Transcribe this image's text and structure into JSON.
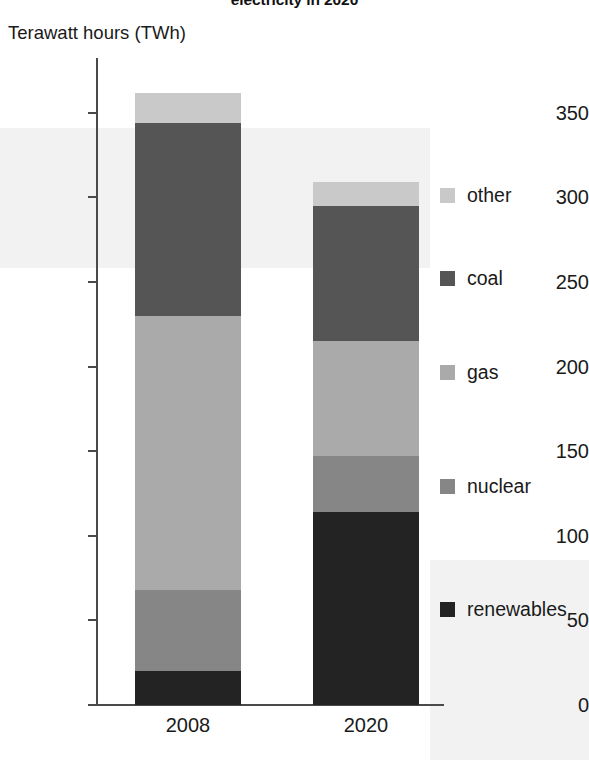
{
  "title": "electricity in 2020",
  "y_axis_label": "Terawatt hours (TWh)",
  "y_ticks": [
    {
      "label": "350",
      "value": 350
    },
    {
      "label": "300",
      "value": 300
    },
    {
      "label": "250",
      "value": 250
    },
    {
      "label": "200",
      "value": 200
    },
    {
      "label": "150",
      "value": 150
    },
    {
      "label": "100",
      "value": 100
    },
    {
      "label": "50",
      "value": 50
    },
    {
      "label": "0",
      "value": 0
    }
  ],
  "x_labels": [
    "2008",
    "2020"
  ],
  "legend": [
    {
      "label": "other",
      "color": "#c9c9c9"
    },
    {
      "label": "coal",
      "color": "#555555"
    },
    {
      "label": "gas",
      "color": "#aaaaaa"
    },
    {
      "label": "nuclear",
      "color": "#868686"
    },
    {
      "label": "renewables",
      "color": "#232323"
    }
  ],
  "chart_data": {
    "type": "bar",
    "stacked": true,
    "title": "electricity in 2020",
    "xlabel": "",
    "ylabel": "Terawatt hours (TWh)",
    "ylim": [
      0,
      380
    ],
    "grid": false,
    "legend_position": "right",
    "categories": [
      "2008",
      "2020"
    ],
    "series": [
      {
        "name": "renewables",
        "color": "#232323",
        "values": [
          20,
          114
        ]
      },
      {
        "name": "nuclear",
        "color": "#868686",
        "values": [
          48,
          33
        ]
      },
      {
        "name": "gas",
        "color": "#aaaaaa",
        "values": [
          162,
          68
        ]
      },
      {
        "name": "coal",
        "color": "#555555",
        "values": [
          114,
          80
        ]
      },
      {
        "name": "other",
        "color": "#c9c9c9",
        "values": [
          18,
          14
        ]
      }
    ],
    "totals": [
      362,
      309
    ]
  }
}
